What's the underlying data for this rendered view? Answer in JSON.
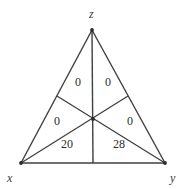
{
  "figure": {
    "type": "triangle-cevian-diagram",
    "background_color": "#ffffff",
    "line_color": "#3f3f3f",
    "text_color": "#2b2b2b",
    "vertices": [
      {
        "name": "apex-top",
        "label": "z",
        "x": 92,
        "y": 30,
        "label_x": 89,
        "label_y": 8
      },
      {
        "name": "vertex-bottom-left",
        "label": "x",
        "x": 21,
        "y": 163,
        "label_x": 7,
        "label_y": 172
      },
      {
        "name": "vertex-bottom-right",
        "label": "y",
        "x": 165,
        "y": 163,
        "label_x": 170,
        "label_y": 172
      }
    ],
    "centroid": {
      "x": 93,
      "y": 119
    },
    "side_points": [
      {
        "name": "left-side-point",
        "x": 57,
        "y": 96
      },
      {
        "name": "right-side-point",
        "x": 128,
        "y": 96
      },
      {
        "name": "base-point",
        "x": 93,
        "y": 163
      }
    ],
    "regions": [
      {
        "name": "region-top-left",
        "value": "0",
        "x": 78,
        "y": 82
      },
      {
        "name": "region-top-right",
        "value": "0",
        "x": 108,
        "y": 82
      },
      {
        "name": "region-mid-left",
        "value": "0",
        "x": 57,
        "y": 121
      },
      {
        "name": "region-mid-right",
        "value": "0",
        "x": 130,
        "y": 121
      },
      {
        "name": "region-bottom-left",
        "value": "20",
        "x": 67,
        "y": 144
      },
      {
        "name": "region-bottom-right",
        "value": "28",
        "x": 119,
        "y": 144
      }
    ]
  }
}
